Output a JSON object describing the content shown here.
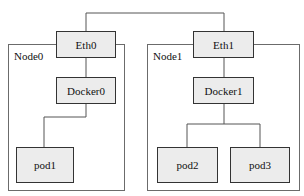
{
  "diagram": {
    "type": "network-topology",
    "colors": {
      "background": "#ffffff",
      "box_fill": "#ececec",
      "box_border": "#333333",
      "frame_border": "#6b6b6b",
      "wire": "#555555",
      "text": "#111111"
    },
    "nodes": [
      {
        "label": "Node0",
        "interface": "Eth0",
        "bridge": "Docker0",
        "pods": [
          "pod1"
        ]
      },
      {
        "label": "Node1",
        "interface": "Eth1",
        "bridge": "Docker1",
        "pods": [
          "pod2",
          "pod3"
        ]
      }
    ],
    "edges": [
      {
        "from": "Eth0",
        "to": "Eth1"
      },
      {
        "from": "Eth0",
        "to": "Docker0"
      },
      {
        "from": "Docker0",
        "to": "pod1"
      },
      {
        "from": "Eth1",
        "to": "Docker1"
      },
      {
        "from": "Docker1",
        "to": "pod2"
      },
      {
        "from": "Docker1",
        "to": "pod3"
      }
    ]
  }
}
